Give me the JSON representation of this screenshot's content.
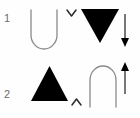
{
  "canvas": {
    "width": 140,
    "height": 118,
    "background_color": "#fefefe",
    "stroke_color": "#8a8a8a",
    "fill_color": "#000000",
    "label_color": "#6b6b6b"
  },
  "rows": [
    {
      "label": "1",
      "items": [
        {
          "name": "u-open-up",
          "icon": "u-shape-outline-icon",
          "description": "outlined U shape opening upward",
          "style": "outline",
          "orientation": "up"
        },
        {
          "name": "chevron-down",
          "icon": "chevron-down-icon",
          "description": "small chevron pointing down",
          "style": "outline",
          "orientation": "down"
        },
        {
          "name": "triangle-down",
          "icon": "triangle-down-filled-icon",
          "description": "solid black triangle pointing down",
          "style": "filled",
          "orientation": "down"
        },
        {
          "name": "arrow-down",
          "icon": "arrow-down-icon",
          "description": "vertical arrow pointing down",
          "style": "filled",
          "orientation": "down"
        }
      ]
    },
    {
      "label": "2",
      "items": [
        {
          "name": "triangle-up",
          "icon": "triangle-up-filled-icon",
          "description": "solid black triangle pointing up",
          "style": "filled",
          "orientation": "up"
        },
        {
          "name": "chevron-up",
          "icon": "chevron-up-icon",
          "description": "small chevron pointing up",
          "style": "outline",
          "orientation": "up"
        },
        {
          "name": "arch-open-down",
          "icon": "arch-outline-icon",
          "description": "outlined arch opening downward",
          "style": "outline",
          "orientation": "down"
        },
        {
          "name": "arrow-up",
          "icon": "arrow-up-icon",
          "description": "vertical arrow pointing up",
          "style": "filled",
          "orientation": "up"
        }
      ]
    }
  ]
}
